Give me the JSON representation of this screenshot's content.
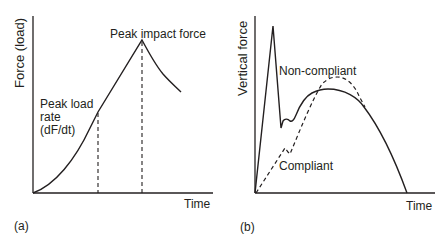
{
  "panels": [
    {
      "id": "a",
      "caption": "(a)",
      "ylabel": "Force (load)",
      "xlabel": "Time",
      "annotations": {
        "peak_impact": "Peak impact force",
        "load_rate_line1": "Peak load",
        "load_rate_line2": "rate",
        "load_rate_line3": "(dF/dt)"
      }
    },
    {
      "id": "b",
      "caption": "(b)",
      "ylabel": "Vertical force",
      "xlabel": "Time",
      "annotations": {
        "non_compliant": "Non-compliant",
        "compliant": "Compliant"
      }
    }
  ],
  "colors": {
    "line": "#231f20",
    "background": "#ffffff"
  }
}
